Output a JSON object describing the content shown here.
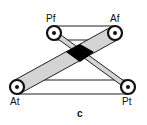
{
  "diagram": {
    "caption": "c",
    "nodes": [
      {
        "id": "Pf",
        "label": "Pf"
      },
      {
        "id": "Af",
        "label": "Af"
      },
      {
        "id": "At",
        "label": "At"
      },
      {
        "id": "Pt",
        "label": "Pt"
      }
    ],
    "bands": [
      {
        "from": "Pf",
        "to": "Pt",
        "fill": "#d4d4d4"
      },
      {
        "from": "Af",
        "to": "At",
        "fill": "#d4d4d4"
      }
    ],
    "connections": [
      {
        "from": "Pf",
        "to": "Af",
        "style": "line"
      },
      {
        "from": "At",
        "to": "Pt",
        "style": "line"
      }
    ],
    "overlap_fill": "#000000"
  }
}
